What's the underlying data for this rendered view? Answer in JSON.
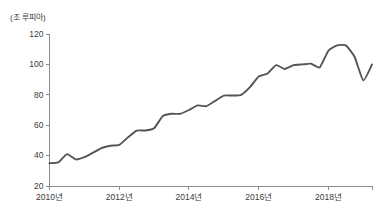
{
  "chart_data": {
    "type": "line",
    "title": "",
    "subtitle": "",
    "unit_label": "(조 루피아)",
    "xlabel": "",
    "ylabel": "",
    "ylim": [
      20,
      120
    ],
    "xlim": [
      2010.0,
      2019.25
    ],
    "grid": false,
    "legend": null,
    "y_ticks": [
      120,
      100,
      80,
      60,
      40,
      20
    ],
    "y_tick_labels": [
      "120",
      "100",
      "80",
      "60",
      "40",
      "20"
    ],
    "x_ticks": [
      2010,
      2012,
      2014,
      2016,
      2018
    ],
    "x_tick_labels": [
      "2010년",
      "2012년",
      "2014년",
      "2016년",
      "2018년"
    ],
    "line_color": "#555555",
    "axis_color": "#8c8c8c",
    "series": [
      {
        "name": "",
        "x": [
          2010.0,
          2010.25,
          2010.5,
          2010.75,
          2011.0,
          2011.25,
          2011.5,
          2011.75,
          2012.0,
          2012.25,
          2012.5,
          2012.75,
          2013.0,
          2013.25,
          2013.5,
          2013.75,
          2014.0,
          2014.25,
          2014.5,
          2014.75,
          2015.0,
          2015.25,
          2015.5,
          2015.75,
          2016.0,
          2016.25,
          2016.5,
          2016.75,
          2017.0,
          2017.25,
          2017.5,
          2017.75,
          2018.0,
          2018.25,
          2018.5,
          2018.75,
          2019.0,
          2019.25
        ],
        "values": [
          35,
          35.5,
          41,
          37.5,
          39,
          42,
          45,
          46.5,
          47,
          52,
          56.5,
          56.5,
          58,
          66,
          67.5,
          67.5,
          70,
          73,
          72.5,
          76,
          79.5,
          79.5,
          80,
          85,
          92,
          94,
          99.5,
          97,
          99.5,
          100,
          100.5,
          98,
          109,
          112.5,
          112.5,
          105,
          89.5,
          100
        ]
      }
    ],
    "annotations": [
      {
        "text": "seasonal quarterly step pattern, rising trend"
      },
      {
        "text": "peak 112.5 near 2018"
      },
      {
        "text": "trough 89.5 near 2019"
      }
    ]
  },
  "axis": {
    "unit_label": "(조 루피아)"
  }
}
